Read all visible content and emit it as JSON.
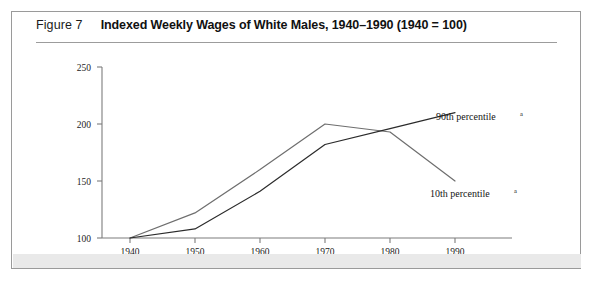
{
  "figure": {
    "number_label": "Figure 7",
    "title": "Indexed Weekly Wages of White Males, 1940–1990 (1940 = 100)"
  },
  "chart_data": {
    "type": "line",
    "title": "Indexed Weekly Wages of White Males, 1940–1990 (1940 = 100)",
    "xlabel": "",
    "ylabel": "",
    "x": [
      1940,
      1950,
      1960,
      1970,
      1980,
      1990
    ],
    "xticklabels": [
      "1940",
      "1950",
      "1960",
      "1970",
      "1980",
      "1990"
    ],
    "yticks": [
      100,
      150,
      200,
      250
    ],
    "yticklabels": [
      "100",
      "150",
      "200",
      "250"
    ],
    "xlim": [
      1936,
      1994
    ],
    "ylim": [
      100,
      255
    ],
    "grid": false,
    "legend_position": "inline-annotation",
    "series": [
      {
        "name": "90th percentile",
        "superscript": "a",
        "color": "#2b2b2b",
        "values": [
          100,
          108,
          141,
          182,
          196,
          210
        ],
        "label_text": "90th percentile"
      },
      {
        "name": "10th percentile",
        "superscript": "a",
        "color": "#6e6e6e",
        "values": [
          100,
          122,
          160,
          200,
          193,
          150
        ],
        "label_text": "10th percentile"
      }
    ],
    "annotations": [
      {
        "text": "90th percentile",
        "superscript": "a",
        "x": 1984,
        "y": 222
      },
      {
        "text": "10th percentile",
        "superscript": "a",
        "x": 1978,
        "y": 142
      }
    ]
  }
}
